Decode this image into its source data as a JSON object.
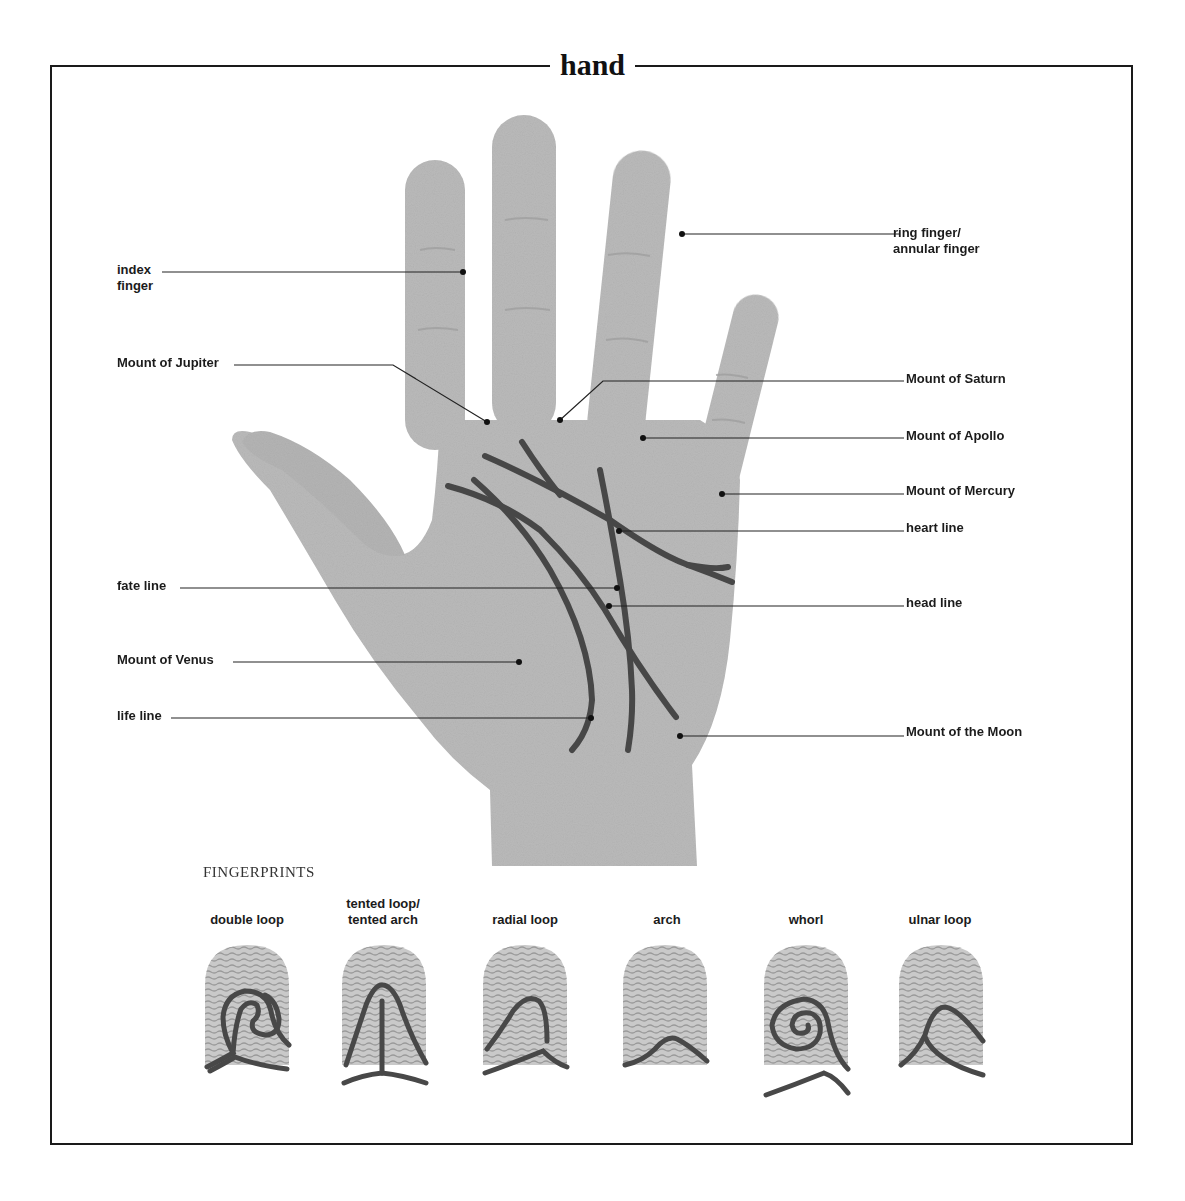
{
  "title": "hand",
  "colors": {
    "skin": "#b9b9b9",
    "skin_shade": "#a9a9a9",
    "palm_line": "#4a4a4a",
    "leader": "#222222",
    "frame": "#1a1a1a"
  },
  "hand_labels": {
    "index_finger": {
      "line1": "index",
      "line2": "finger"
    },
    "ring_finger": {
      "line1": "ring finger/",
      "line2": "annular finger"
    },
    "mount_jupiter": "Mount of Jupiter",
    "mount_saturn": "Mount of Saturn",
    "mount_apollo": "Mount of Apollo",
    "mount_mercury": "Mount of Mercury",
    "heart_line": "heart line",
    "fate_line": "fate line",
    "head_line": "head line",
    "mount_venus": "Mount of Venus",
    "life_line": "life line",
    "mount_moon": "Mount of the Moon"
  },
  "fingerprints": {
    "section_title": "FINGERPRINTS",
    "types": [
      {
        "line1": "",
        "line2": "double loop"
      },
      {
        "line1": "tented loop/",
        "line2": "tented arch"
      },
      {
        "line1": "",
        "line2": "radial loop"
      },
      {
        "line1": "",
        "line2": "arch"
      },
      {
        "line1": "",
        "line2": "whorl"
      },
      {
        "line1": "",
        "line2": "ulnar loop"
      }
    ]
  }
}
